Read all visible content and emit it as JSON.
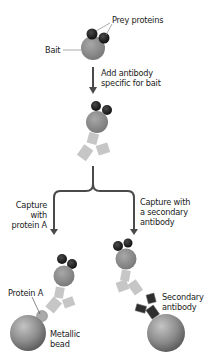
{
  "labels": {
    "prey_proteins": "Prey proteins",
    "bait": "Bait",
    "step1_line1": "Add antibody",
    "step1_line2": "specific for bait",
    "left_branch_line1": "Capture",
    "left_branch_line2": "with",
    "left_branch_line3": "protein A",
    "right_branch_line1": "Capture with",
    "right_branch_line2": "a secondary",
    "right_branch_line3": "antibody",
    "protein_a": "Protein A",
    "metallic_bead_line1": "Metallic",
    "metallic_bead_line2": "bead",
    "secondary_antibody_line1": "Secondary",
    "secondary_antibody_line2": "antibody"
  },
  "colors": {
    "prey": "#1e1e1e",
    "bait": "#8c8c8c",
    "antibody": "#c4c4c4",
    "secondary_antibody": "#2e2e2e",
    "bead": "#8a8a8a",
    "arrow": "#4a4a4a"
  }
}
